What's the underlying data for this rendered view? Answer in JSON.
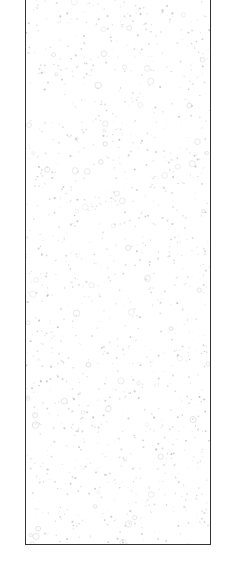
{
  "canvas": {
    "width": 231,
    "height": 583,
    "background": "#ffffff"
  },
  "swatch": {
    "border_color": "#333333",
    "fill_color": "#ffffff",
    "speckle_color": "#bdbdbd",
    "texture": "light gray speckle / terrazzo-like dots"
  }
}
